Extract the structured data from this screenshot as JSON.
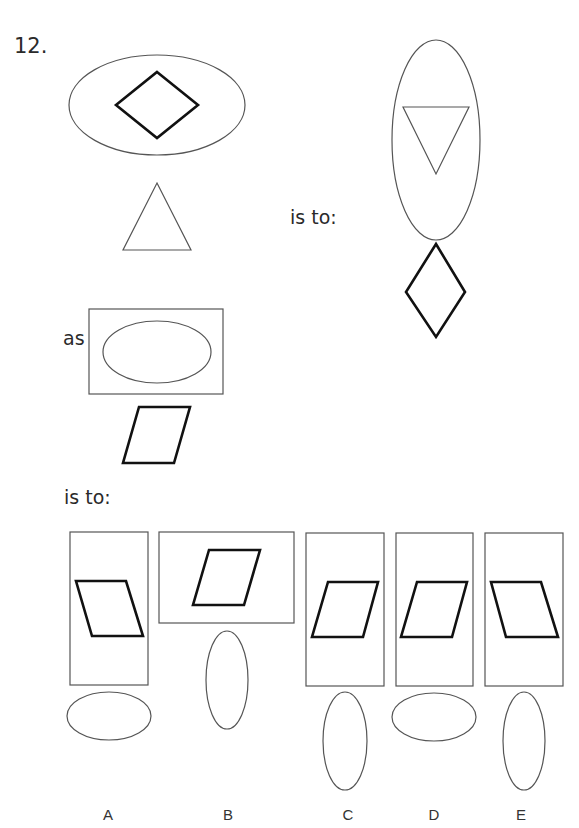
{
  "question": {
    "number": "12.",
    "connector_is_to": "is to:",
    "connector_as": "as",
    "connector_is_to_2": "is to:"
  },
  "answer_options": [
    {
      "label": "A"
    },
    {
      "label": "B"
    },
    {
      "label": "C"
    },
    {
      "label": "D"
    },
    {
      "label": "E"
    }
  ],
  "colors": {
    "thin_stroke": "#555555",
    "thick_stroke": "#111111",
    "background": "#ffffff"
  }
}
